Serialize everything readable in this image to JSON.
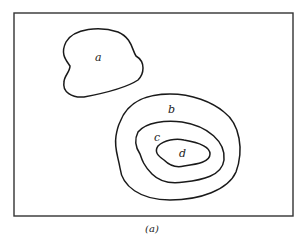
{
  "figure": {
    "caption": "(a)",
    "regions": [
      {
        "id": "a",
        "label": "a"
      },
      {
        "id": "b",
        "label": "b"
      },
      {
        "id": "c",
        "label": "c"
      },
      {
        "id": "d",
        "label": "d"
      }
    ],
    "colors": {
      "stroke": "#1a1a1a",
      "background": "#ffffff"
    }
  }
}
